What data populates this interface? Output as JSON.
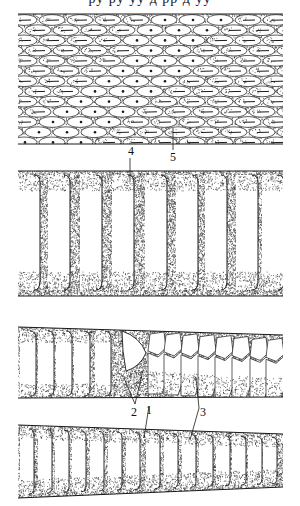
{
  "figure": {
    "cropped_caption_fragment": "ру ру уу д рр д уу",
    "panels": [
      {
        "id": "panel-1",
        "description": "dorsal scales with keels, band of dotted (pitted) scales",
        "y_top": 14,
        "y_bottom": 144
      },
      {
        "id": "panel-2",
        "description": "broad ventral scutes",
        "y_top": 171,
        "y_bottom": 296
      },
      {
        "id": "panel-3",
        "description": "ventral scutes transitioning to paired subcaudal scales",
        "y_top_left": 327,
        "y_top_right": 335,
        "y_bottom_left": 398,
        "y_bottom_right": 397
      },
      {
        "id": "panel-4",
        "description": "ventral scutes with undivided subcaudals, tapering",
        "y_top_left": 425,
        "y_top_right": 434,
        "y_bottom_left": 498,
        "y_bottom_right": 487
      }
    ],
    "labels": [
      {
        "text": "4",
        "x": 128,
        "y": 155,
        "line": [
          130,
          158,
          130,
          182
        ]
      },
      {
        "text": "5",
        "x": 170,
        "y": 161,
        "line": [
          173,
          150,
          173,
          128
        ]
      },
      {
        "text": "2",
        "x": 131,
        "y": 416,
        "line_a": [
          135,
          404,
          124,
          378
        ],
        "line_b": [
          135,
          404,
          143,
          370
        ]
      },
      {
        "text": "1",
        "x": 146,
        "y": 414,
        "line": [
          149,
          406,
          144,
          438
        ]
      },
      {
        "text": "3",
        "x": 200,
        "y": 416,
        "line_a": [
          199,
          408,
          196,
          378
        ],
        "line_b": [
          199,
          408,
          190,
          440
        ]
      }
    ],
    "colors": {
      "ink": "#1a1a1a",
      "paper": "#ffffff",
      "stipple": "#3a3a3a"
    }
  }
}
